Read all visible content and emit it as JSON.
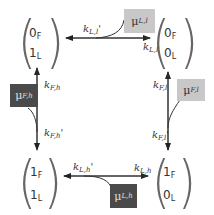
{
  "states": {
    "top_left": {
      "row1": "0",
      "row1_sub": "F",
      "row2": "1",
      "row2_sub": "L"
    },
    "top_right": {
      "row1": "0",
      "row1_sub": "F",
      "row2": "0",
      "row2_sub": "L"
    },
    "bottom_left": {
      "row1": "1",
      "row1_sub": "F",
      "row2": "1",
      "row2_sub": "L"
    },
    "bottom_right": {
      "row1": "1",
      "row1_sub": "F",
      "row2": "0",
      "row2_sub": "L"
    }
  },
  "rates": {
    "top_backward": {
      "k": "k",
      "sub": "L,l",
      "prime": "'"
    },
    "top_forward": {
      "k": "k",
      "sub": "L,l",
      "prime": ""
    },
    "left_up": {
      "k": "k",
      "sub": "F,h",
      "prime": ""
    },
    "left_down": {
      "k": "k",
      "sub": "F,h",
      "prime": "'"
    },
    "right_up": {
      "k": "k",
      "sub": "F,l",
      "prime": ""
    },
    "right_down": {
      "k": "k",
      "sub": "F,l",
      "prime": "'"
    },
    "bottom_backward": {
      "k": "k",
      "sub": "L,h",
      "prime": "'"
    },
    "bottom_forward": {
      "k": "k",
      "sub": "L,h",
      "prime": ""
    }
  },
  "mu_boxes": {
    "mu_Ll": {
      "symbol": "μ",
      "sub": "L,l",
      "shade": "light"
    },
    "mu_Fh": {
      "symbol": "μ",
      "sub": "F,h",
      "shade": "dark"
    },
    "mu_Fl": {
      "symbol": "μ",
      "sub": "F,l",
      "shade": "light"
    },
    "mu_Lh": {
      "symbol": "μ",
      "sub": "L,h",
      "shade": "dark"
    }
  },
  "colors": {
    "light_box": "#c8c8c8",
    "dark_box": "#4a4a4a",
    "line": "#333333",
    "paren": "#666666"
  }
}
